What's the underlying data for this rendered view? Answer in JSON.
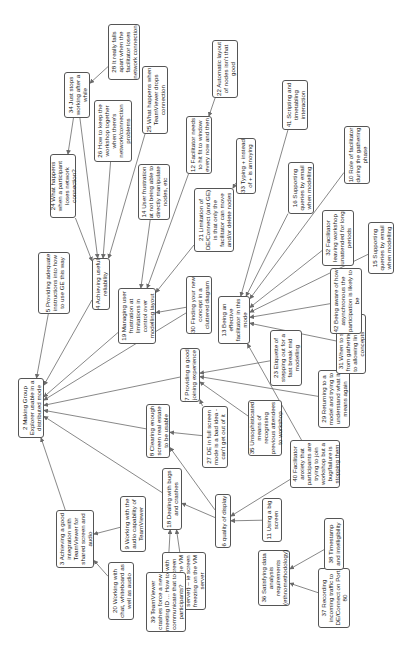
{
  "diagram": {
    "type": "concept map (rotated 90°)",
    "nodes": [
      {
        "id": "2",
        "label": "2 Making Group Explorer usable in a distributed mode",
        "x": 18,
        "y": 378,
        "w": 26,
        "h": 60,
        "tw": 58
      },
      {
        "id": "3",
        "label": "3 Achieving a good integration with TeamViewer for shared screen and audio",
        "x": 56,
        "y": 510,
        "w": 38,
        "h": 58,
        "tw": 56
      },
      {
        "id": "4",
        "label": "4 Achieving useful reliability",
        "x": 92,
        "y": 258,
        "w": 18,
        "h": 52,
        "tw": 50
      },
      {
        "id": "5",
        "label": "5 Providing adequate instructions into how to use GE this way",
        "x": 38,
        "y": 252,
        "w": 32,
        "h": 62,
        "tw": 60
      },
      {
        "id": "6",
        "label": "6 quality of display",
        "x": 215,
        "y": 494,
        "w": 16,
        "h": 54,
        "tw": 52
      },
      {
        "id": "7",
        "label": "7 Providing a good joining experience",
        "x": 180,
        "y": 348,
        "w": 20,
        "h": 54,
        "tw": 52
      },
      {
        "id": "8",
        "label": "8 Clearing enough screen real estate to be usable",
        "x": 146,
        "y": 404,
        "w": 24,
        "h": 54,
        "tw": 52
      },
      {
        "id": "9",
        "label": "9 Working with the audio capability of TeamViewer",
        "x": 120,
        "y": 496,
        "w": 26,
        "h": 56,
        "tw": 54
      },
      {
        "id": "10",
        "label": "10 Role of facilitator during the gathering phase",
        "x": 344,
        "y": 126,
        "w": 26,
        "h": 58,
        "tw": 56
      },
      {
        "id": "11",
        "label": "11 Using a big screen",
        "x": 262,
        "y": 498,
        "w": 20,
        "h": 44,
        "tw": 42
      },
      {
        "id": "12",
        "label": "12 Facilitator needs to hit fit to window every now and then",
        "x": 186,
        "y": 116,
        "w": 26,
        "h": 58,
        "tw": 56
      },
      {
        "id": "13",
        "label": "13 Being an effective facilitator in this mode",
        "x": 218,
        "y": 296,
        "w": 32,
        "h": 48,
        "tw": 46
      },
      {
        "id": "14",
        "label": "14 User frustration at not being able to directly manipulate nodes, etc",
        "x": 138,
        "y": 164,
        "w": 32,
        "h": 56,
        "tw": 54
      },
      {
        "id": "15",
        "label": "15 Supporting queries by email when modelling",
        "x": 368,
        "y": 222,
        "w": 26,
        "h": 52,
        "tw": 50
      },
      {
        "id": "16",
        "label": "16 Supporting queries by email when modelling",
        "x": 288,
        "y": 162,
        "w": 26,
        "h": 52,
        "tw": 50
      },
      {
        "id": "17",
        "label": "17 Dealing with errors (ie screen freezing on the VM server) – ie screen freezing on the VM server",
        "x": 162,
        "y": 552,
        "w": 44,
        "h": 58,
        "tw": 56
      },
      {
        "id": "18",
        "label": "18 Dealing with bugs and crashes",
        "x": 162,
        "y": 468,
        "w": 20,
        "h": 62,
        "tw": 60
      },
      {
        "id": "19",
        "label": "19 Managing user frustration at limitations in control over modelling layout",
        "x": 118,
        "y": 288,
        "w": 38,
        "h": 56,
        "tw": 54
      },
      {
        "id": "20",
        "label": "20 Working with chat, whiteboard as well as audio",
        "x": 108,
        "y": 562,
        "w": 26,
        "h": 58,
        "tw": 56
      },
      {
        "id": "21",
        "label": "21 Limitation of DE/Connect (and GE) is that only the facilitator can move and/or delete nodes",
        "x": 194,
        "y": 188,
        "w": 40,
        "h": 64,
        "tw": 62
      },
      {
        "id": "22",
        "label": "22 Automatic layout of nodes isn't that good",
        "x": 212,
        "y": 40,
        "w": 26,
        "h": 58,
        "tw": 56
      },
      {
        "id": "23",
        "label": "23 Etiquette of stepping out for a fast break mid modelling",
        "x": 270,
        "y": 330,
        "w": 32,
        "h": 56,
        "tw": 54
      },
      {
        "id": "24",
        "label": "24 What happens when a participant loses network connection?",
        "x": 50,
        "y": 154,
        "w": 26,
        "h": 64,
        "tw": 62
      },
      {
        "id": "25",
        "label": "25 What happens when TeamViewer drops connection",
        "x": 142,
        "y": 66,
        "w": 26,
        "h": 68,
        "tw": 66
      },
      {
        "id": "26",
        "label": "26 How to keep the workshop together when there's network/connection problems",
        "x": 94,
        "y": 100,
        "w": 38,
        "h": 62,
        "tw": 60
      },
      {
        "id": "27",
        "label": "27 DE in full screen mode is a bad idea - can't get out of it",
        "x": 202,
        "y": 406,
        "w": 26,
        "h": 62,
        "tw": 60
      },
      {
        "id": "28",
        "label": "28 It really falls apart when the facilitator loses network connection",
        "x": 108,
        "y": 24,
        "w": 32,
        "h": 56,
        "tw": 54
      },
      {
        "id": "29",
        "label": "29 Returning to a model and trying to understand what it means again",
        "x": 318,
        "y": 370,
        "w": 32,
        "h": 58,
        "tw": 56
      },
      {
        "id": "30",
        "label": "30 Finding your new concept in a cluttered diagram",
        "x": 186,
        "y": 276,
        "w": 26,
        "h": 58,
        "tw": 56
      },
      {
        "id": "31",
        "label": "31 When to switch from gathering only, to allowing linking of concepts",
        "x": 336,
        "y": 314,
        "w": 30,
        "h": 60,
        "tw": 58
      },
      {
        "id": "32",
        "label": "32 Facilitator leaving workshop unattended for long periods",
        "x": 322,
        "y": 210,
        "w": 32,
        "h": 56,
        "tw": 54
      },
      {
        "id": "33",
        "label": "33 Typing + instead of + is annoying",
        "x": 236,
        "y": 138,
        "w": 20,
        "h": 56,
        "tw": 54
      },
      {
        "id": "34",
        "label": "34 Just stops working after a while",
        "x": 64,
        "y": 72,
        "w": 26,
        "h": 46,
        "tw": 44
      },
      {
        "id": "35",
        "label": "35 Unsophisticated means of recognising previous attendees to workshop",
        "x": 248,
        "y": 400,
        "w": 34,
        "h": 56,
        "tw": 54
      },
      {
        "id": "36",
        "label": "36 Satisfying data analysis requirements (ethnomethodology)",
        "x": 258,
        "y": 550,
        "w": 32,
        "h": 56,
        "tw": 54
      },
      {
        "id": "37",
        "label": "37 Recording incoming traffic to DE/Connect on Port 80",
        "x": 318,
        "y": 568,
        "w": 32,
        "h": 60,
        "tw": 58
      },
      {
        "id": "38",
        "label": "38 Timestamp and intelligibility",
        "x": 324,
        "y": 518,
        "w": 20,
        "h": 52,
        "tw": 50
      },
      {
        "id": "39",
        "label": "39 TeamViewer crashes force a new meeting ID ... How to communicate that to participants?",
        "x": 146,
        "y": 572,
        "w": 40,
        "h": 60,
        "tw": 58
      },
      {
        "id": "40",
        "label": "40 Facilitator anxiety that participants are trying to join workshop but a bug/failure is stopping them",
        "x": 290,
        "y": 440,
        "w": 50,
        "h": 48,
        "tw": 46
      },
      {
        "id": "41",
        "label": "41 Scripting and timetabling interaction",
        "x": 282,
        "y": 80,
        "w": 26,
        "h": 50,
        "tw": 48
      },
      {
        "id": "42",
        "label": "42 Being aware of how asynchronous the participation is likely to be",
        "x": 330,
        "y": 268,
        "w": 32,
        "h": 66,
        "tw": 64
      }
    ],
    "edges": [
      [
        "34",
        "24"
      ],
      [
        "28",
        "34"
      ],
      [
        "22",
        "12"
      ],
      [
        "33",
        "21"
      ],
      [
        "24",
        "4"
      ],
      [
        "26",
        "4"
      ],
      [
        "25",
        "4"
      ],
      [
        "34",
        "4"
      ],
      [
        "14",
        "19"
      ],
      [
        "12",
        "19"
      ],
      [
        "21",
        "19"
      ],
      [
        "30",
        "19"
      ],
      [
        "4",
        "2"
      ],
      [
        "5",
        "2"
      ],
      [
        "19",
        "2"
      ],
      [
        "30",
        "2"
      ],
      [
        "7",
        "2"
      ],
      [
        "8",
        "2"
      ],
      [
        "18",
        "2"
      ],
      [
        "3",
        "2"
      ],
      [
        "9",
        "3"
      ],
      [
        "20",
        "3"
      ],
      [
        "41",
        "13"
      ],
      [
        "16",
        "13"
      ],
      [
        "10",
        "13"
      ],
      [
        "32",
        "13"
      ],
      [
        "15",
        "13"
      ],
      [
        "42",
        "13"
      ],
      [
        "31",
        "13"
      ],
      [
        "40",
        "13"
      ],
      [
        "23",
        "7"
      ],
      [
        "29",
        "7"
      ],
      [
        "35",
        "7"
      ],
      [
        "27",
        "7"
      ],
      [
        "27",
        "8"
      ],
      [
        "6",
        "8"
      ],
      [
        "6",
        "18"
      ],
      [
        "17",
        "18"
      ],
      [
        "39",
        "18"
      ],
      [
        "11",
        "6"
      ],
      [
        "40",
        "6"
      ],
      [
        "38",
        "36"
      ],
      [
        "37",
        "36"
      ]
    ]
  }
}
